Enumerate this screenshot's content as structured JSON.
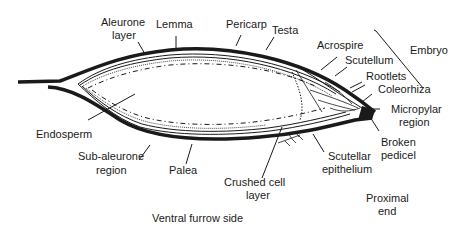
{
  "diagram": {
    "type": "cross-section",
    "labels": {
      "aleurone_layer_1": "Aleurone",
      "aleurone_layer_2": "layer",
      "lemma": "Lemma",
      "pericarp": "Pericarp",
      "testa": "Testa",
      "acrospire": "Acrospire",
      "embryo": "Embryo",
      "scutellum": "Scutellum",
      "rootlets": "Rootlets",
      "coleorhiza": "Coleorhiza",
      "micropylar_1": "Micropylar",
      "micropylar_2": "region",
      "endosperm": "Endosperm",
      "broken_pedicel_1": "Broken",
      "broken_pedicel_2": "pedicel",
      "sub_aleurone_1": "Sub-aleurone",
      "sub_aleurone_2": "region",
      "palea": "Palea",
      "scutellar_epithelium_1": "Scutellar",
      "scutellar_epithelium_2": "epithelium",
      "crushed_cell_1": "Crushed cell",
      "crushed_cell_2": "layer",
      "proximal_end_1": "Proximal",
      "proximal_end_2": "end",
      "ventral_furrow": "Ventral furrow side"
    },
    "colors": {
      "ink": "#1a1a1a",
      "background": "#ffffff"
    }
  }
}
